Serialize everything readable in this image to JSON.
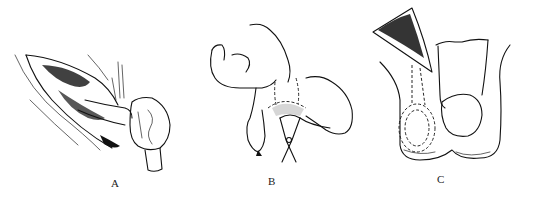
{
  "figure": {
    "panels": [
      {
        "id": "A",
        "label": "A",
        "description": "incision with exposed spermatic cord and testis delivered"
      },
      {
        "id": "B",
        "label": "B",
        "description": "fingers and forceps manipulating testis with dotted region"
      },
      {
        "id": "C",
        "label": "C",
        "description": "scrotum with dashed outline of testis path below incision"
      }
    ],
    "colors": {
      "ink": "#111111",
      "background": "#ffffff"
    }
  }
}
